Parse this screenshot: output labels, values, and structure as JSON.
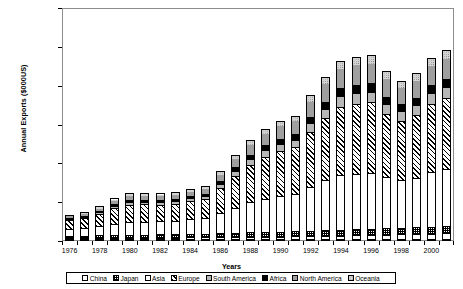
{
  "chart_data": {
    "type": "bar",
    "stacked": true,
    "title": "",
    "xlabel": "Years",
    "ylabel": "Annual Exports ($000US)",
    "ylim": [
      0,
      60000000
    ],
    "ytick_step": 10000000,
    "ytick_labels": [
      "60,000,000",
      "50,000,000",
      "40,000,000",
      "30,000,000",
      "20,000,000",
      "10,000,000",
      "0"
    ],
    "ytick_values": [
      60000000,
      50000000,
      40000000,
      30000000,
      20000000,
      10000000,
      0
    ],
    "grid": true,
    "legend_position": "bottom",
    "categories": [
      "1976",
      "1977",
      "1978",
      "1979",
      "1980",
      "1981",
      "1982",
      "1983",
      "1984",
      "1985",
      "1986",
      "1987",
      "1988",
      "1989",
      "1990",
      "1991",
      "1992",
      "1993",
      "1994",
      "1995",
      "1996",
      "1997",
      "1998",
      "1999",
      "2000",
      "2001"
    ],
    "xtick_labels_shown": [
      "1976",
      "1978",
      "1980",
      "1982",
      "1984",
      "1986",
      "1988",
      "1990",
      "1992",
      "1994",
      "1996",
      "1998",
      "2000"
    ],
    "series": [
      {
        "name": "China",
        "pattern": "p-white",
        "values": [
          250000,
          260000,
          280000,
          300000,
          330000,
          350000,
          380000,
          400000,
          430000,
          450000,
          480000,
          520000,
          560000,
          600000,
          650000,
          700000,
          760000,
          820000,
          900000,
          980000,
          1060000,
          1150000,
          1240000,
          1330000,
          1430000,
          1520000
        ]
      },
      {
        "name": "Japan",
        "pattern": "p-checker",
        "values": [
          620000,
          660000,
          700000,
          760000,
          800000,
          840000,
          880000,
          920000,
          960000,
          1000000,
          1050000,
          1100000,
          1160000,
          1210000,
          1270000,
          1330000,
          1390000,
          1450000,
          1520000,
          1580000,
          1640000,
          1700000,
          1640000,
          1700000,
          1760000,
          1800000
        ]
      },
      {
        "name": "Asia",
        "pattern": "p-white",
        "values": [
          1900000,
          2100000,
          2500000,
          3100000,
          3500000,
          3500000,
          3500000,
          3600000,
          3900000,
          4100000,
          5300000,
          6600000,
          7900000,
          8800000,
          9400000,
          9800000,
          11500000,
          13000000,
          14200000,
          14500000,
          14600000,
          13200000,
          12400000,
          13000000,
          14200000,
          14800000
        ]
      },
      {
        "name": "Europe",
        "pattern": "p-hatch",
        "values": [
          2400000,
          2700000,
          3300000,
          4100000,
          4600000,
          4600000,
          4500000,
          4600000,
          4900000,
          5200000,
          6800000,
          8400000,
          9900000,
          11000000,
          11800000,
          12300000,
          14400000,
          16200000,
          17800000,
          18200000,
          18300000,
          16600000,
          15600000,
          16300000,
          17800000,
          18600000
        ]
      },
      {
        "name": "South America",
        "pattern": "p-dotgray",
        "values": [
          380000,
          420000,
          500000,
          620000,
          700000,
          700000,
          690000,
          700000,
          750000,
          790000,
          1000000,
          1280000,
          1500000,
          1680000,
          1800000,
          1870000,
          2200000,
          2470000,
          2710000,
          2770000,
          2790000,
          2530000,
          2380000,
          2480000,
          2710000,
          2830000
        ]
      },
      {
        "name": "Africa",
        "pattern": "p-black",
        "values": [
          300000,
          330000,
          390000,
          480000,
          540000,
          540000,
          530000,
          540000,
          580000,
          610000,
          780000,
          990000,
          1160000,
          1300000,
          1390000,
          1450000,
          1700000,
          1910000,
          2100000,
          2150000,
          2160000,
          1960000,
          1840000,
          1920000,
          2100000,
          2190000
        ]
      },
      {
        "name": "North America",
        "pattern": "p-gray",
        "values": [
          700000,
          780000,
          950000,
          1180000,
          1330000,
          1330000,
          1300000,
          1330000,
          1420000,
          1500000,
          1950000,
          2450000,
          2880000,
          3210000,
          3440000,
          3580000,
          4200000,
          4730000,
          5200000,
          5320000,
          5350000,
          4850000,
          4560000,
          4760000,
          5200000,
          5430000
        ]
      },
      {
        "name": "Oceania",
        "pattern": "p-ltgray",
        "values": [
          250000,
          280000,
          340000,
          420000,
          470000,
          470000,
          460000,
          470000,
          500000,
          530000,
          690000,
          870000,
          1020000,
          1140000,
          1220000,
          1270000,
          1490000,
          1680000,
          1840000,
          1880000,
          1890000,
          1720000,
          1620000,
          1690000,
          1840000,
          1920000
        ]
      }
    ],
    "totals": [
      6800000,
      7530000,
      8960000,
      10960000,
      12270000,
      12330000,
      12240000,
      12560000,
      13440000,
      14180000,
      18050000,
      22210000,
      26080000,
      28940000,
      30970000,
      32300000,
      37640000,
      42260000,
      46270000,
      47380000,
      47790000,
      43710000,
      41280000,
      43180000,
      47040000,
      49090000
    ]
  },
  "legend": {
    "items": [
      {
        "label": "China",
        "pattern": "p-white"
      },
      {
        "label": "Japan",
        "pattern": "p-checker"
      },
      {
        "label": "Asia",
        "pattern": "p-white"
      },
      {
        "label": "Europe",
        "pattern": "p-hatch"
      },
      {
        "label": "South America",
        "pattern": "p-dotgray"
      },
      {
        "label": "Africa",
        "pattern": "p-black"
      },
      {
        "label": "North America",
        "pattern": "p-gray"
      },
      {
        "label": "Oceania",
        "pattern": "p-ltgray"
      }
    ]
  },
  "colors": {
    "axis": "#000000",
    "grid": "#9a9a9a",
    "frame": "#8d8d8d",
    "background": "#ffffff"
  }
}
